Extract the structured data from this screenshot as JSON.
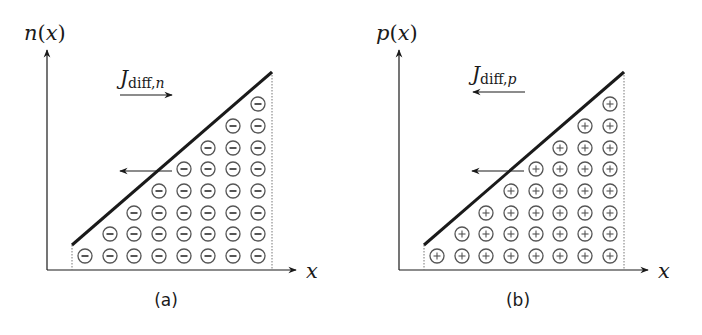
{
  "figure": {
    "panels": [
      {
        "id": "a",
        "caption": "(a)",
        "y_label": "n(x)",
        "y_label_func": "n",
        "x_label": "x",
        "current_label_main": "J",
        "current_label_sub": "diff,",
        "current_label_sub_var": "n",
        "current_arrow_direction": "right",
        "particle_flow_arrow_direction": "left",
        "particle_symbol": "minus",
        "particle_glyph": "⊖",
        "offset_x": 0
      },
      {
        "id": "b",
        "caption": "(b)",
        "y_label": "p(x)",
        "y_label_func": "p",
        "x_label": "x",
        "current_label_main": "J",
        "current_label_sub": "diff,",
        "current_label_sub_var": "p",
        "current_arrow_direction": "left",
        "particle_flow_arrow_direction": "left",
        "particle_symbol": "plus",
        "particle_glyph": "⊕",
        "offset_x": 352
      }
    ],
    "grid": {
      "columns": 8,
      "column_heights": [
        1,
        2,
        3,
        4,
        5,
        6,
        7,
        8
      ],
      "col_x": [
        85,
        110,
        134,
        159,
        184,
        208,
        233,
        258
      ],
      "row_y": [
        256,
        234,
        213,
        191,
        169,
        148,
        126,
        104
      ],
      "circle_radius": 7
    },
    "concentration_line": {
      "start": [
        72,
        245
      ],
      "end": [
        272,
        72
      ]
    },
    "colors": {
      "ink": "#1a1a1a",
      "particle": "#555555",
      "dotted": "#777777"
    }
  }
}
